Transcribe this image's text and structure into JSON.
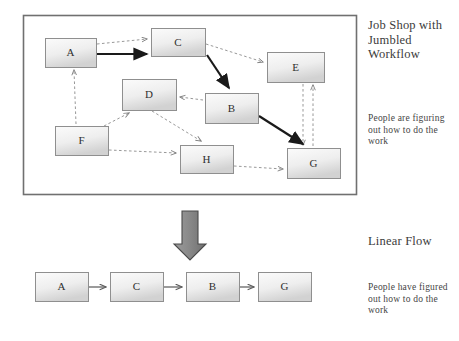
{
  "page": {
    "width": 459,
    "height": 341,
    "background": "#ffffff"
  },
  "colors": {
    "box_fill_light": "#f4f4f4",
    "box_fill_dark": "#d4d4d4",
    "box_stroke": "#8f8f8f",
    "frame_stroke": "#6e6e6e",
    "solid_arrow": "#1a1a1a",
    "dashed_arrow": "#8c8c8c",
    "big_arrow_fill": "#8a8a8a",
    "big_arrow_stroke": "#4a4a4a",
    "text": "#3a3a3a"
  },
  "top_diagram": {
    "frame": {
      "x": 23,
      "y": 15,
      "w": 334,
      "h": 180
    },
    "nodes": [
      {
        "id": "A",
        "label": "A",
        "x": 45,
        "y": 38,
        "w": 51,
        "h": 29
      },
      {
        "id": "C",
        "label": "C",
        "x": 151,
        "y": 28,
        "w": 54,
        "h": 28
      },
      {
        "id": "E",
        "label": "E",
        "x": 267,
        "y": 52,
        "w": 57,
        "h": 30
      },
      {
        "id": "D",
        "label": "D",
        "x": 122,
        "y": 79,
        "w": 54,
        "h": 31
      },
      {
        "id": "B",
        "label": "B",
        "x": 205,
        "y": 93,
        "w": 53,
        "h": 30
      },
      {
        "id": "F",
        "label": "F",
        "x": 55,
        "y": 126,
        "w": 53,
        "h": 29
      },
      {
        "id": "H",
        "label": "H",
        "x": 180,
        "y": 145,
        "w": 53,
        "h": 28
      },
      {
        "id": "G",
        "label": "G",
        "x": 287,
        "y": 148,
        "w": 53,
        "h": 30
      }
    ],
    "solid_edges": [
      {
        "from": "A",
        "to": "C"
      },
      {
        "from": "C",
        "to": "B"
      },
      {
        "from": "B",
        "to": "G"
      }
    ],
    "dashed_edges": [
      {
        "from": "A",
        "to": "C"
      },
      {
        "from": "C",
        "to": "E"
      },
      {
        "from": "B",
        "to": "D"
      },
      {
        "from": "F",
        "to": "A"
      },
      {
        "from": "F",
        "to": "D"
      },
      {
        "from": "F",
        "to": "H"
      },
      {
        "from": "D",
        "to": "H"
      },
      {
        "from": "H",
        "to": "G"
      },
      {
        "from": "E",
        "to": "G"
      },
      {
        "from": "G",
        "to": "E"
      }
    ]
  },
  "transition_arrow": {
    "label": "down-arrow",
    "x": 178,
    "y": 211,
    "w": 24,
    "h": 48
  },
  "bottom_diagram": {
    "nodes": [
      {
        "id": "A",
        "label": "A",
        "x": 35,
        "y": 272,
        "w": 53,
        "h": 29
      },
      {
        "id": "C",
        "label": "C",
        "x": 110,
        "y": 272,
        "w": 53,
        "h": 29
      },
      {
        "id": "B",
        "label": "B",
        "x": 186,
        "y": 272,
        "w": 53,
        "h": 29
      },
      {
        "id": "G",
        "label": "G",
        "x": 258,
        "y": 272,
        "w": 53,
        "h": 29
      }
    ],
    "solid_edges": [
      {
        "from": "A",
        "to": "C"
      },
      {
        "from": "C",
        "to": "B"
      },
      {
        "from": "B",
        "to": "G"
      }
    ]
  },
  "annotations": {
    "jobshop_heading": "Job Shop with Jumbled Workflow",
    "jobshop_body": "People are figuring out how to do the work",
    "linear_heading": "Linear Flow",
    "linear_body": "People have figured out how to do the work"
  }
}
